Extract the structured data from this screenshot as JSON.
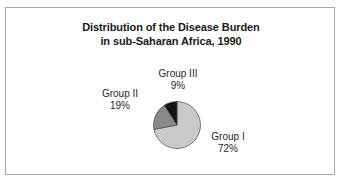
{
  "figure": {
    "title_line_1": "Distribution of the Disease Burden",
    "title_line_2": "in sub-Saharan Africa, 1990",
    "border_color": "#a9a9a9",
    "background_color": "#ffffff"
  },
  "labels": {
    "group_iii": {
      "name": "Group III",
      "value": "9%"
    },
    "group_ii": {
      "name": "Group II",
      "value": "19%"
    },
    "group_i": {
      "name": "Group I",
      "value": "72%"
    }
  },
  "chart_data": {
    "type": "pie",
    "title": "Distribution of the Disease Burden in sub-Saharan Africa, 1990",
    "xlabel": "",
    "ylabel": "",
    "categories": [
      "Group I",
      "Group II",
      "Group III"
    ],
    "values": [
      72,
      19,
      9
    ],
    "value_labels": [
      "72%",
      "19%",
      "9%"
    ],
    "unit": "percent",
    "colors": [
      "#c9c9c9",
      "#8a8a8a",
      "#141414"
    ],
    "slice_edge_color": "#4a4a4a",
    "start_angle_deg": 0,
    "direction": "clockwise",
    "legend": "none",
    "labels_position": "outside-with-leader-free",
    "grid": false,
    "annotations": [
      "Group III 9%",
      "Group II 19%",
      "Group I 72%"
    ]
  }
}
